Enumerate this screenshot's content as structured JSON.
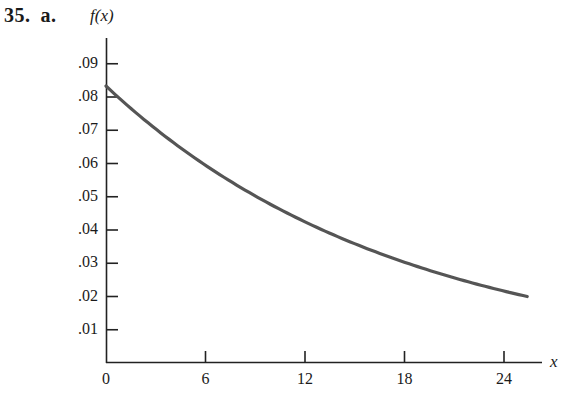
{
  "header": {
    "problem_number": "35.",
    "part": "a."
  },
  "chart_data": {
    "type": "line",
    "title": "",
    "xlabel": "x",
    "ylabel": "f(x)",
    "xlim": [
      0,
      26
    ],
    "ylim": [
      0,
      0.097
    ],
    "grid": false,
    "legend": null,
    "x_ticks": [
      0,
      6,
      12,
      18,
      24
    ],
    "x_tick_labels": [
      "0",
      "6",
      "12",
      "18",
      "24"
    ],
    "y_ticks": [
      0.01,
      0.02,
      0.03,
      0.04,
      0.05,
      0.06,
      0.07,
      0.08,
      0.09
    ],
    "y_tick_labels": [
      ".01",
      ".02",
      ".03",
      ".04",
      ".05",
      ".06",
      ".07",
      ".08",
      ".09"
    ],
    "series": [
      {
        "name": "f(x)",
        "color": "#555555",
        "x": [
          0,
          2,
          4,
          6,
          8,
          10,
          12,
          14,
          16,
          18,
          20,
          22,
          24,
          25.4
        ],
        "y": [
          0.0833,
          0.074,
          0.0657,
          0.059,
          0.0525,
          0.047,
          0.042,
          0.0375,
          0.0335,
          0.03,
          0.0268,
          0.024,
          0.0213,
          0.02
        ]
      }
    ]
  },
  "axis_labels": {
    "y": "f(x)",
    "x": "x"
  }
}
